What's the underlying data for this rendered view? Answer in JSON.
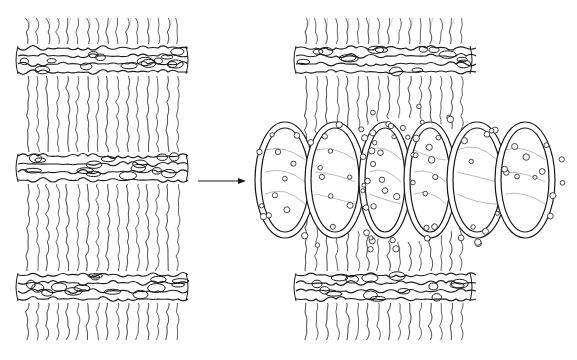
{
  "figure": {
    "stroke_color": "#1a1a1a",
    "background": "#ffffff"
  },
  "panels": [
    {
      "id": "left",
      "label": "condensed chromosome segment",
      "x": 22,
      "width": 160,
      "bands_y": [
        60,
        168,
        287
      ]
    },
    {
      "id": "right",
      "label": "puffed chromosome segment",
      "x": 300,
      "width": 166,
      "bands_y": [
        60,
        287
      ],
      "puff": {
        "cx": 405,
        "cy": 180,
        "rx": 150,
        "ry": 62
      }
    }
  ],
  "arrow": {
    "x1": 198,
    "x2": 246,
    "y": 181,
    "icon": "right-arrow-icon"
  }
}
